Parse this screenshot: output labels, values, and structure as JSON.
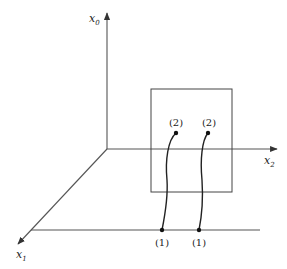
{
  "diagram": {
    "axes": {
      "x0": {
        "label": "x",
        "subscript": "0"
      },
      "x1": {
        "label": "x",
        "subscript": "1"
      },
      "x2": {
        "label": "x",
        "subscript": "2"
      }
    },
    "points": {
      "upper_left": "(2)",
      "upper_right": "(2)",
      "lower_left": "(1)",
      "lower_right": "(1)"
    },
    "colors": {
      "axis": "#555555",
      "curve": "#222222",
      "background": "#ffffff"
    }
  }
}
